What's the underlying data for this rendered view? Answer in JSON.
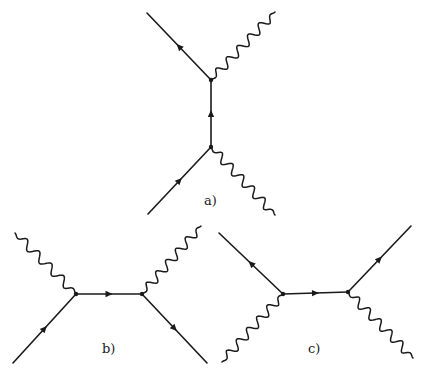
{
  "figure": {
    "colors": {
      "ink": "#1a1a1a",
      "background": "#ffffff"
    },
    "diagrams": [
      {
        "id": "a",
        "label": "a)",
        "label_pos": [
          204,
          205
        ],
        "vertices": [
          [
            211,
            80
          ],
          [
            211,
            147
          ]
        ],
        "fermions": [
          {
            "from": [
              148,
              214
            ],
            "to": [
              211,
              147
            ],
            "arrow_dir": "forward"
          },
          {
            "from": [
              211,
              147
            ],
            "to": [
              211,
              80
            ],
            "arrow_dir": "forward"
          },
          {
            "from": [
              211,
              80
            ],
            "to": [
              147,
              13
            ],
            "arrow_dir": "forward"
          }
        ],
        "photons": [
          {
            "from": [
              211,
              80
            ],
            "to": [
              275,
              12
            ]
          },
          {
            "from": [
              211,
              147
            ],
            "to": [
              275,
              215
            ]
          }
        ]
      },
      {
        "id": "b",
        "label": "b)",
        "label_pos": [
          102,
          353
        ],
        "vertices": [
          [
            76,
            294
          ],
          [
            142,
            294
          ]
        ],
        "fermions": [
          {
            "from": [
              13,
              363
            ],
            "to": [
              76,
              294
            ],
            "arrow_dir": "forward"
          },
          {
            "from": [
              76,
              294
            ],
            "to": [
              142,
              294
            ],
            "arrow_dir": "forward"
          },
          {
            "from": [
              142,
              294
            ],
            "to": [
              207,
              363
            ],
            "arrow_dir": "forward"
          }
        ],
        "photons": [
          {
            "from": [
              15,
              233
            ],
            "to": [
              76,
              294
            ]
          },
          {
            "from": [
              142,
              294
            ],
            "to": [
              201,
              226
            ]
          }
        ]
      },
      {
        "id": "c",
        "label": "c)",
        "label_pos": [
          308,
          353
        ],
        "vertices": [
          [
            283,
            294
          ],
          [
            348,
            292
          ]
        ],
        "fermions": [
          {
            "from": [
              283,
              294
            ],
            "to": [
              219,
              233
            ],
            "arrow_dir": "forward"
          },
          {
            "from": [
              283,
              294
            ],
            "to": [
              348,
              292
            ],
            "arrow_dir": "forward"
          },
          {
            "from": [
              348,
              292
            ],
            "to": [
              411,
              226
            ],
            "arrow_dir": "forward"
          }
        ],
        "photons": [
          {
            "from": [
              283,
              294
            ],
            "to": [
              222,
              362
            ]
          },
          {
            "from": [
              348,
              292
            ],
            "to": [
              413,
              358
            ]
          }
        ]
      }
    ]
  }
}
